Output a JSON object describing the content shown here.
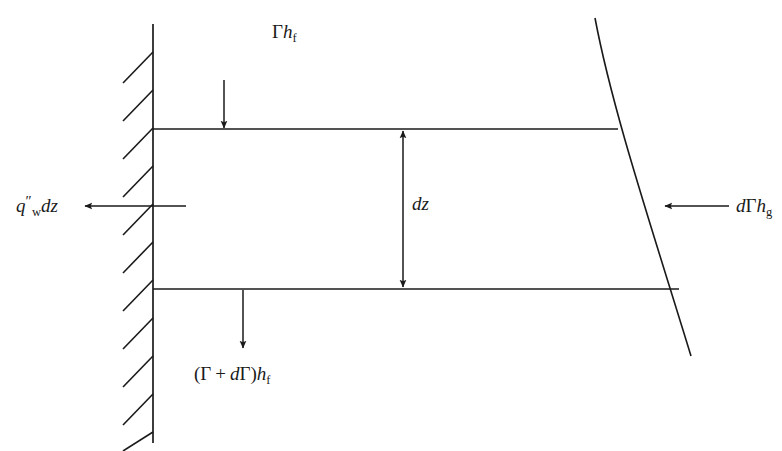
{
  "figure": {
    "background_color": "#ffffff",
    "line_color": "#1a1a1a",
    "width": 782,
    "height": 451
  },
  "labels": {
    "inlet_flow": {
      "name": "gamma-h-f",
      "plain": "Γh_f",
      "parts": {
        "gamma": "Γ",
        "h": "h",
        "sub": "f"
      }
    },
    "wall_heat_flux": {
      "name": "q-double-prime-w-dz",
      "plain": "q″_w dz",
      "parts": {
        "q": "q",
        "prime": "″",
        "sub": "w",
        "dz": "dz"
      }
    },
    "height": {
      "name": "dz",
      "plain": "dz",
      "parts": {
        "d": "d",
        "z": "z"
      }
    },
    "vapor_flow": {
      "name": "d-gamma-h-g",
      "plain": "dΓh_g",
      "parts": {
        "d": "d",
        "gamma": "Γ",
        "h": "h",
        "sub": "g"
      }
    },
    "outlet_flow": {
      "name": "gamma-plus-d-gamma-h-f",
      "plain": "(Γ + dΓ)h_f",
      "parts": {
        "open": "(",
        "gamma": "Γ",
        "plus": "+",
        "d": "d",
        "gamma2": "Γ",
        "close": ")",
        "h": "h",
        "sub": "f"
      }
    }
  },
  "geometry": {
    "wall": {
      "x": 153,
      "y_top": 24,
      "y_bottom": 443,
      "stroke_width": 1.6
    },
    "hatch": {
      "count": 11,
      "dx": -30,
      "dy": 31,
      "spacing": 38,
      "y_start": 52,
      "stroke_width": 1.6
    },
    "top_line": {
      "x1": 153,
      "y1": 129,
      "x2": 618,
      "y2": 129
    },
    "bottom_line": {
      "x1": 153,
      "y1": 289,
      "x2": 679,
      "y2": 289
    },
    "film_curve": {
      "x_start": 595,
      "y_start": 18,
      "x_end": 691,
      "y_end": 356
    },
    "arrow_inlet": {
      "x": 224,
      "y1": 80,
      "y2": 129,
      "direction": "down"
    },
    "arrow_outlet": {
      "x": 243,
      "y1": 289,
      "y2": 348,
      "direction": "down"
    },
    "arrow_wall": {
      "y": 206,
      "x1": 185,
      "x2": 84,
      "direction": "left"
    },
    "arrow_vapor": {
      "y": 206,
      "x1": 729,
      "x2": 664,
      "direction": "left"
    },
    "arrow_dz": {
      "x": 403,
      "y1": 129,
      "y2": 289,
      "direction": "both"
    }
  }
}
